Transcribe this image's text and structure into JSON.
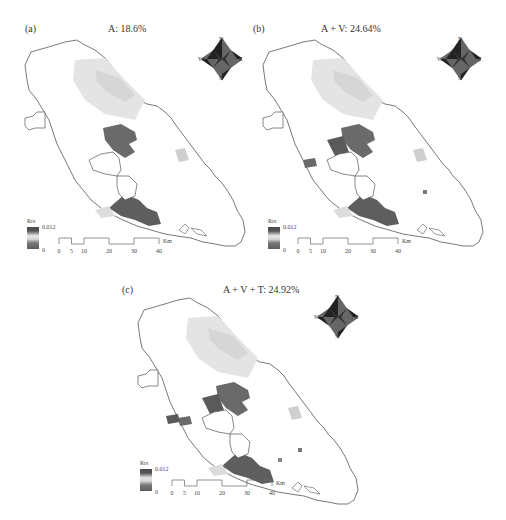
{
  "figure": {
    "panels": [
      {
        "id": "a",
        "label": "(a)",
        "title": "A: 18.6%"
      },
      {
        "id": "b",
        "label": "(b)",
        "title": "A + V: 24.64%"
      },
      {
        "id": "c",
        "label": "(c)",
        "title": "A + V + T: 24.92%"
      }
    ],
    "compass": {
      "north": "N",
      "south": "S",
      "east": "E",
      "west": "W"
    },
    "legend": {
      "title": "Rrs",
      "max_label": "0.012",
      "min_label": "0",
      "color_high": "#4a4a4a",
      "color_low": "#5c5c5c",
      "color_mid": "#e6e6e6"
    },
    "scale": {
      "ticks": [
        "0",
        "5",
        "10",
        "20",
        "30",
        "40"
      ],
      "unit": "Km"
    }
  }
}
